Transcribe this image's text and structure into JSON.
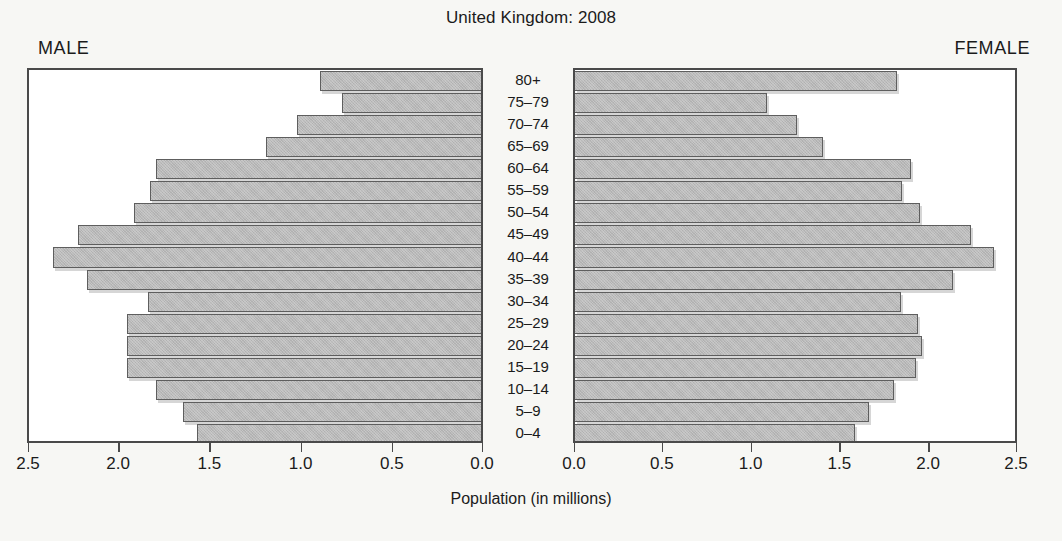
{
  "chart_data": {
    "type": "bar",
    "subtype": "population-pyramid",
    "title": "United Kingdom: 2008",
    "xlabel": "Population (in millions)",
    "ylabel": "",
    "grid": false,
    "legend_position": "none",
    "left_panel_label": "MALE",
    "right_panel_label": "FEMALE",
    "categories": [
      "80+",
      "75–79",
      "70–74",
      "65–69",
      "60–64",
      "55–59",
      "50–54",
      "45–49",
      "40–44",
      "35–39",
      "30–34",
      "25–29",
      "20–24",
      "15–19",
      "10–14",
      "5–9",
      "0–4"
    ],
    "xlim": [
      0.0,
      2.5
    ],
    "axis_max": 2.5,
    "left_tick_labels": [
      "2.5",
      "2.0",
      "1.5",
      "1.0",
      "0.5",
      "0.0"
    ],
    "right_tick_labels": [
      "0.0",
      "0.5",
      "1.0",
      "1.5",
      "2.0",
      "2.5"
    ],
    "tick_values": [
      0.0,
      0.5,
      1.0,
      1.5,
      2.0,
      2.5
    ],
    "series": [
      {
        "name": "MALE",
        "direction": "left",
        "values": [
          0.89,
          0.77,
          1.02,
          1.19,
          1.8,
          1.83,
          1.92,
          2.23,
          2.37,
          2.18,
          1.84,
          1.96,
          1.96,
          1.96,
          1.8,
          1.65,
          1.57
        ]
      },
      {
        "name": "FEMALE",
        "direction": "right",
        "values": [
          1.83,
          1.09,
          1.26,
          1.41,
          1.91,
          1.86,
          1.96,
          2.25,
          2.38,
          2.15,
          1.85,
          1.95,
          1.97,
          1.94,
          1.81,
          1.67,
          1.59
        ]
      }
    ],
    "colors": {
      "bar_fill": "#b9b9b9",
      "bar_border": "#5e5e5e",
      "axis": "#4a4a4a",
      "text": "#1b1b1b",
      "background": "#f7f7f4"
    }
  }
}
